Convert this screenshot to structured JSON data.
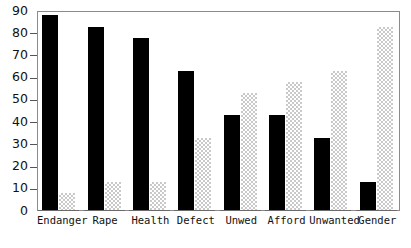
{
  "chart_data": {
    "type": "bar",
    "title": "",
    "xlabel": "",
    "ylabel": "",
    "ylim": [
      0,
      90
    ],
    "ytick_values": [
      0,
      10,
      20,
      30,
      40,
      50,
      60,
      70,
      80,
      90
    ],
    "ytick_labels": [
      "0",
      "10",
      "20",
      "30",
      "40",
      "50",
      "60",
      "70",
      "80",
      "90"
    ],
    "grid": false,
    "legend_position": "none",
    "categories": [
      "Endanger",
      "Rape",
      "Health",
      "Defect",
      "Unwed",
      "Afford",
      "Unwanted",
      "Gender"
    ],
    "series": [
      {
        "name": "dark",
        "fill": "solid-black",
        "color": "#000000",
        "values": [
          88,
          83,
          78,
          63,
          43,
          43,
          33,
          13
        ]
      },
      {
        "name": "light",
        "fill": "stippled-gray",
        "color": "#c9c9c9",
        "values": [
          8,
          13,
          13,
          33,
          53,
          58,
          63,
          83
        ]
      }
    ]
  },
  "axes": {
    "frame_color": "#8b8b8b",
    "tick_color": "#555555",
    "baseline_color": "#6a6a6a",
    "background": "#ffffff"
  }
}
